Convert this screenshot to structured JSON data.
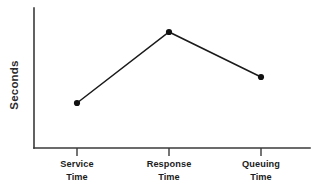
{
  "chart_data": {
    "type": "line",
    "title": "",
    "subtitle": "",
    "xlabel": "",
    "ylabel": "Seconds",
    "categories": [
      "Service Time",
      "Response Time",
      "Queuing Time"
    ],
    "category_lines": [
      [
        "Service",
        "Time"
      ],
      [
        "Response",
        "Time"
      ],
      [
        "Queuing",
        "Time"
      ]
    ],
    "series": [
      {
        "name": "Seconds",
        "values": [
          1.0,
          3.0,
          2.1
        ]
      }
    ],
    "ylim": [
      0,
      3.5
    ],
    "y_ticks": [],
    "y_tick_labels": [],
    "grid": false,
    "legend": false,
    "legend_position": "none",
    "annotations": [],
    "marker": "circle",
    "line_color": "#1a1a1a",
    "marker_color": "#111111",
    "axis_color": "#3a3a3a",
    "background_color": "#ffffff"
  },
  "figure": {
    "width": 320,
    "height": 196,
    "plot_left": 34,
    "plot_right": 310,
    "plot_top": 8,
    "plot_bottom": 148,
    "tick_length": 8,
    "point_pixels": [
      {
        "x": 77,
        "y": 103
      },
      {
        "x": 169,
        "y": 32
      },
      {
        "x": 261,
        "y": 77
      }
    ],
    "tick_x": [
      77,
      169,
      261
    ],
    "ylabel_x": 18,
    "ylabel_y": 85,
    "xlabel_line1_y": 167,
    "xlabel_line2_y": 180
  }
}
